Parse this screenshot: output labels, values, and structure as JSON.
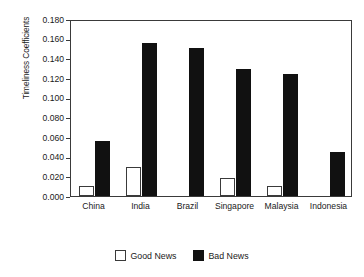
{
  "chart_data": {
    "type": "bar",
    "title": "",
    "xlabel": "",
    "ylabel": "Timeliness Coefficients",
    "ylim": [
      0.0,
      0.18
    ],
    "ytick_step": 0.02,
    "ytick_labels": [
      "0.000",
      "0.020",
      "0.040",
      "0.060",
      "0.080",
      "0.100",
      "0.120",
      "0.140",
      "0.160",
      "0.180"
    ],
    "ytick_values": [
      0.0,
      0.02,
      0.04,
      0.06,
      0.08,
      0.1,
      0.12,
      0.14,
      0.16,
      0.18
    ],
    "grid": false,
    "legend_position": "bottom-center",
    "categories": [
      "China",
      "India",
      "Brazil",
      "Singapore",
      "Malaysia",
      "Indonesia"
    ],
    "series": [
      {
        "name": "Good News",
        "color": "#ffffff",
        "edge_color": "#3a3a3a",
        "values": [
          0.01,
          0.03,
          0.0,
          0.018,
          0.01,
          0.0
        ]
      },
      {
        "name": "Bad News",
        "color": "#111111",
        "edge_color": "#111111",
        "values": [
          0.056,
          0.156,
          0.151,
          0.129,
          0.124,
          0.045
        ]
      }
    ]
  },
  "legend": {
    "entries": [
      {
        "label": "Good News"
      },
      {
        "label": "Bad News"
      }
    ]
  }
}
